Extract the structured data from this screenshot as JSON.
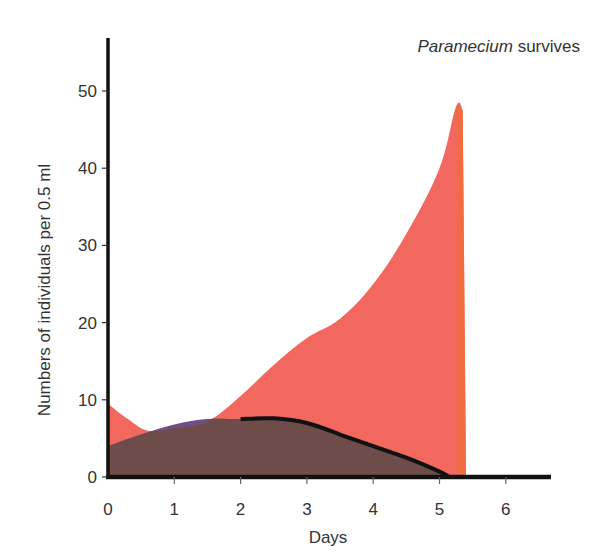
{
  "chart_data": {
    "type": "area",
    "title": "",
    "annotation": {
      "italic": "Paramecium",
      "rest": " survives"
    },
    "xlabel": "Days",
    "ylabel": "Numbers of individuals per 0.5 ml",
    "xlim": [
      0,
      6.7
    ],
    "ylim": [
      0,
      57
    ],
    "xticks": [
      0,
      1,
      2,
      3,
      4,
      5,
      6
    ],
    "yticks": [
      0,
      10,
      20,
      30,
      40,
      50
    ],
    "grid": false,
    "legend": null,
    "series": [
      {
        "name": "Paramecium",
        "color": "#F2675E",
        "edge_color": "#EE6E3C",
        "x": [
          0,
          0.3,
          0.6,
          1.0,
          1.5,
          2.0,
          2.5,
          3.0,
          3.5,
          4.0,
          4.5,
          5.0,
          5.25,
          5.35,
          5.4
        ],
        "values": [
          9.5,
          7.5,
          6.0,
          6.3,
          7.2,
          10.5,
          14.5,
          18.0,
          20.5,
          25.0,
          31.5,
          40.0,
          48.0,
          47.5,
          0
        ]
      },
      {
        "name": "Competing species",
        "color": "#6E4F86",
        "overlap_color": "#6E4C4A",
        "x": [
          0,
          0.5,
          1.0,
          1.5,
          2.0,
          2.5,
          3.0,
          3.5,
          4.0,
          4.5,
          5.0,
          5.15
        ],
        "values": [
          4.0,
          5.5,
          6.8,
          7.5,
          7.5,
          7.6,
          7.0,
          5.5,
          4.0,
          2.5,
          0.7,
          0
        ]
      }
    ]
  },
  "axis": {
    "x_tick_labels": [
      "0",
      "1",
      "2",
      "3",
      "4",
      "5",
      "6"
    ],
    "y_tick_labels": [
      "0",
      "10",
      "20",
      "30",
      "40",
      "50"
    ]
  }
}
